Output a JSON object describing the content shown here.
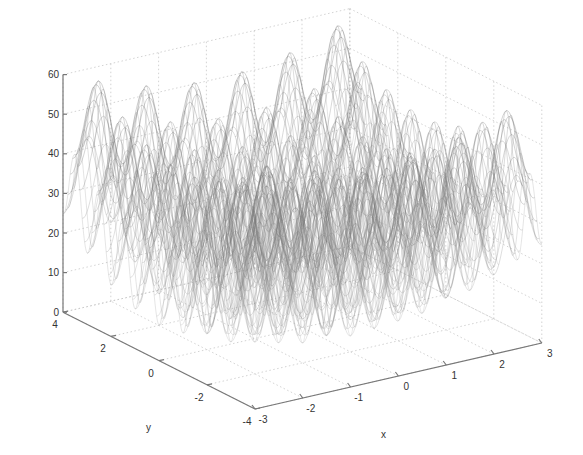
{
  "chart_data": {
    "type": "surface3d",
    "title": "",
    "function": "z = 20 + x^2 + y^2 - 10*(cos(2*pi*x) + cos(2*pi*y))",
    "xlabel": "x",
    "ylabel": "y",
    "zlabel": "",
    "xlim": [
      -3,
      3
    ],
    "ylim": [
      -4,
      4
    ],
    "zlim": [
      0,
      60
    ],
    "x_ticks": [
      -3,
      -2,
      -1,
      0,
      1,
      2,
      3
    ],
    "y_ticks": [
      -4,
      -2,
      0,
      2,
      4
    ],
    "z_ticks": [
      0,
      10,
      20,
      30,
      40,
      50,
      60
    ],
    "x_tick_labels": [
      "-3",
      "-2",
      "-1",
      "0",
      "1",
      "2",
      "3"
    ],
    "y_tick_labels": [
      "-4",
      "-2",
      "0",
      "2",
      "4"
    ],
    "z_tick_labels": [
      "0",
      "10",
      "20",
      "30",
      "40",
      "50",
      "60"
    ],
    "grid": true,
    "style": "mesh",
    "colormap": "grayscale",
    "approx_max": 58,
    "approx_min": 0
  },
  "projection": {
    "origin_px": [
      255,
      409
    ],
    "x_unit_px": [
      47.8,
      -11.0
    ],
    "y_unit_px": [
      -24.0,
      -12.1
    ],
    "z_unit_px": [
      0,
      -3.96
    ]
  },
  "colors": {
    "axis": "#777777",
    "grid": "#c8c8c8",
    "text": "#333333",
    "mesh_dark": "#555555",
    "mesh_light": "#d0d0d0"
  }
}
